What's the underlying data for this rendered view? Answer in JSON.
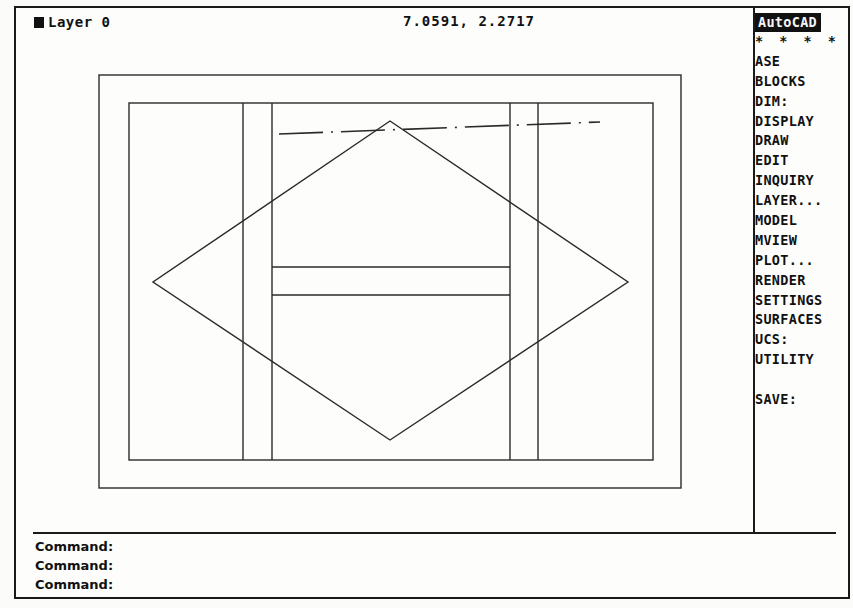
{
  "status_bar": {
    "layer_label": "Layer 0",
    "layer_icon": "filled-square-icon",
    "coordinates": "7.0591, 2.2717"
  },
  "side_menu": {
    "items": [
      {
        "label": "AutoCAD",
        "type": "header"
      },
      {
        "label": "* * * *",
        "type": "stars"
      },
      {
        "label": "ASE"
      },
      {
        "label": "BLOCKS"
      },
      {
        "label": "DIM:"
      },
      {
        "label": "DISPLAY"
      },
      {
        "label": "DRAW"
      },
      {
        "label": "EDIT"
      },
      {
        "label": "INQUIRY"
      },
      {
        "label": "LAYER..."
      },
      {
        "label": "MODEL"
      },
      {
        "label": "MVIEW"
      },
      {
        "label": "PLOT..."
      },
      {
        "label": "RENDER"
      },
      {
        "label": "SETTINGS"
      },
      {
        "label": "SURFACES"
      },
      {
        "label": "UCS:"
      },
      {
        "label": "UTILITY"
      },
      {
        "label": "",
        "type": "blank"
      },
      {
        "label": "SAVE:"
      }
    ]
  },
  "command_area": {
    "lines": [
      "Command:",
      "Command:",
      "Command:"
    ]
  },
  "drawing": {
    "stroke_color": "#2a2a2a",
    "outer_rect": {
      "x": 99,
      "y": 75,
      "w": 582,
      "h": 413
    },
    "inner_rect": {
      "x": 129,
      "y": 103,
      "w": 524,
      "h": 357
    },
    "vertical_lines_x": [
      243,
      272,
      510,
      538
    ],
    "upper_box": {
      "x": 272,
      "y": 103,
      "w": 238,
      "h": 164
    },
    "lower_box": {
      "x": 272,
      "y": 295,
      "w": 238,
      "h": 165
    },
    "diamond": {
      "top": [
        390,
        121
      ],
      "right": [
        628,
        282
      ],
      "bottom": [
        390,
        440
      ],
      "left": [
        153,
        282
      ]
    },
    "centerline": {
      "x1": 279,
      "y1": 134,
      "x2": 600,
      "y2": 122
    }
  }
}
